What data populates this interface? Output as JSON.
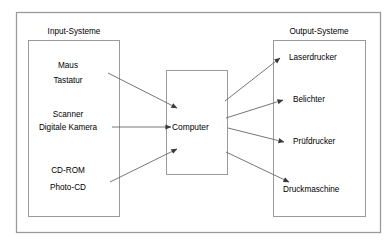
{
  "diagram": {
    "title_visible": false,
    "colors": {
      "stroke": "#808080",
      "arrow": "#555555",
      "text": "#000000",
      "background": "#ffffff"
    },
    "panels": {
      "input": {
        "title": "Input-Systeme",
        "groups": [
          {
            "lines": [
              "Maus",
              "Tastatur"
            ]
          },
          {
            "lines": [
              "Scanner",
              "Digitale Kamera"
            ]
          },
          {
            "lines": [
              "CD-ROM",
              "Photo-CD"
            ]
          }
        ]
      },
      "output": {
        "title": "Output-Systeme",
        "items": [
          "Laserdrucker",
          "Belichter",
          "Prüfdrucker",
          "Druckmaschine"
        ]
      }
    },
    "center": {
      "label": "Computer"
    },
    "connections": [
      {
        "from": "Maus / Tastatur",
        "to": "Computer",
        "direction": "in"
      },
      {
        "from": "Scanner / Digitale Kamera",
        "to": "Computer",
        "direction": "in"
      },
      {
        "from": "CD-ROM / Photo-CD",
        "to": "Computer",
        "direction": "in"
      },
      {
        "from": "Computer",
        "to": "Laserdrucker",
        "direction": "out"
      },
      {
        "from": "Computer",
        "to": "Belichter",
        "direction": "out"
      },
      {
        "from": "Computer",
        "to": "Prüfdrucker",
        "direction": "out"
      },
      {
        "from": "Computer",
        "to": "Druckmaschine",
        "direction": "out"
      }
    ]
  }
}
